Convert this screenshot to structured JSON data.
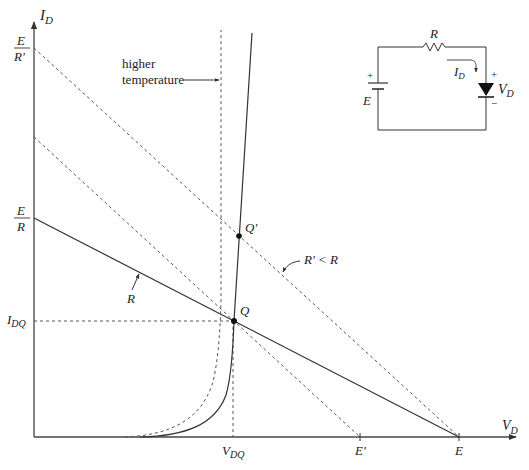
{
  "figure": {
    "type": "diode load-line diagram",
    "axes": {
      "x_label": "V",
      "x_label_sub": "D",
      "y_label": "I",
      "y_label_sub": "D"
    },
    "y_axis_ticks": {
      "top_num": "E",
      "top_den": "R'",
      "mid_num": "E",
      "mid_den": "R",
      "idq": "I",
      "idq_sub": "DQ"
    },
    "x_axis_ticks": {
      "vdq": "V",
      "vdq_sub": "DQ",
      "e_prime": "E'",
      "e": "E"
    },
    "annotations": {
      "higher_temp_line1": "higher",
      "higher_temp_line2": "temperature",
      "load_line_r": "R",
      "load_line_r_prime": "R' < R",
      "q_point": "Q",
      "q_prime_point": "Q'"
    },
    "circuit": {
      "resistor": "R",
      "current": "I",
      "current_sub": "D",
      "source": "E",
      "source_plus": "+",
      "diode_voltage": "V",
      "diode_voltage_sub": "D",
      "diode_plus": "+",
      "diode_minus": "−"
    },
    "colors": {
      "line": "#333333",
      "dashed": "#555555"
    }
  }
}
